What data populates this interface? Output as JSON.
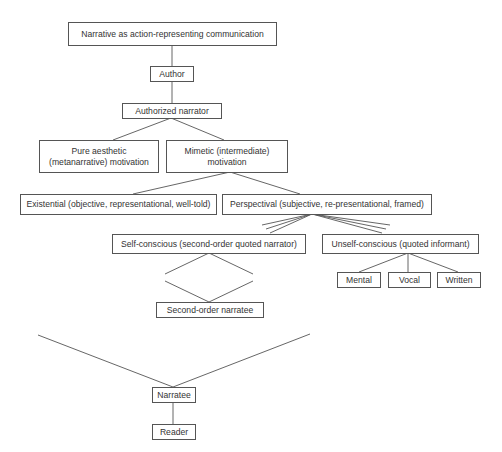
{
  "diagram": {
    "type": "hierarchy",
    "nodes": {
      "root": "Narrative as action-representing communication",
      "author": "Author",
      "authorized_narrator": "Authorized narrator",
      "pure_aesthetic": "Pure aesthetic (metanarrative) motivation",
      "mimetic": "Mimetic (intermediate) motivation",
      "existential": "Existential (objective, representational, well-told)",
      "perspectival": "Perspectival (subjective, re-presentational, framed)",
      "self_conscious": "Self-conscious (second-order quoted narrator)",
      "unself_conscious": "Unself-conscious (quoted informant)",
      "mental": "Mental",
      "vocal": "Vocal",
      "written": "Written",
      "second_order_narratee": "Second-order narratee",
      "narratee": "Narratee",
      "reader": "Reader"
    },
    "edges": [
      [
        "root",
        "author"
      ],
      [
        "author",
        "authorized_narrator"
      ],
      [
        "authorized_narrator",
        "pure_aesthetic"
      ],
      [
        "authorized_narrator",
        "mimetic"
      ],
      [
        "mimetic",
        "existential"
      ],
      [
        "mimetic",
        "perspectival"
      ],
      [
        "perspectival",
        "self_conscious",
        "triple-line"
      ],
      [
        "perspectival",
        "unself_conscious",
        "triple-line"
      ],
      [
        "unself_conscious",
        "mental"
      ],
      [
        "unself_conscious",
        "vocal"
      ],
      [
        "unself_conscious",
        "written"
      ],
      [
        "self_conscious",
        "second_order_narratee",
        "diamond"
      ],
      [
        "narratee",
        "reader"
      ]
    ],
    "colors": {
      "line": "#555555",
      "text": "#333333",
      "background": "#ffffff"
    }
  },
  "caption": {
    "text": ""
  }
}
